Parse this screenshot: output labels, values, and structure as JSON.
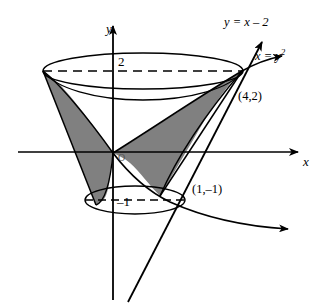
{
  "figure": {
    "axes": {
      "x_label": "x",
      "y_label": "y",
      "origin_label": "O"
    },
    "ticks": [
      {
        "name": "y-tick-2",
        "value": "2"
      },
      {
        "name": "y-tick-neg1",
        "value": "–1"
      }
    ],
    "curves": [
      {
        "name": "line",
        "label_prefix": "y = x – 2"
      },
      {
        "name": "parabola",
        "label_prefix": "x = y",
        "label_exponent": "2"
      }
    ],
    "points": [
      {
        "name": "intersection-upper",
        "label": "(4,2)"
      },
      {
        "name": "intersection-lower",
        "label": "(1,–1)"
      }
    ],
    "colors": {
      "stroke": "#000000",
      "shade": "#808080",
      "background": "#ffffff"
    }
  }
}
